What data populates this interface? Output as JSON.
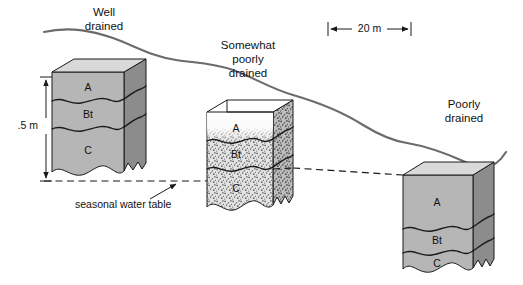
{
  "figure": {
    "background_color": "#ffffff",
    "width": 523,
    "height": 285
  },
  "colors": {
    "top_face": "#d9d9d9",
    "front_face": "#b6b6b6",
    "side_face": "#8c8c8c",
    "stipple_front": "#cfcfcf",
    "stipple_side": "#a8a8a8",
    "white_face": "#ffffff",
    "outline": "#1a1a1a",
    "surface_line": "#6b6b6b",
    "text": "#111111"
  },
  "scale_bar": {
    "label": "20 m",
    "x_start": 328,
    "x_end": 411,
    "y": 29
  },
  "depth_scale": {
    "label": ".5 m",
    "x": 38,
    "y_top": 77,
    "y_bottom": 183
  },
  "water_table": {
    "label": "seasonal water table",
    "y": 181,
    "x_start": 44,
    "x_end": 460,
    "leader_from_x": 152,
    "leader_from_y": 198,
    "leader_to_x": 175,
    "leader_to_y": 184
  },
  "drainage_labels": [
    {
      "id": "well-drained",
      "lines": [
        "Well",
        "drained"
      ],
      "x": 104,
      "y": 13,
      "class": "Well drained"
    },
    {
      "id": "somewhat-poorly-drained",
      "lines": [
        "Somewhat",
        "poorly",
        "drained"
      ],
      "x": 248,
      "y": 44,
      "class": "Somewhat poorly drained"
    },
    {
      "id": "poorly-drained",
      "lines": [
        "Poorly",
        "drained"
      ],
      "x": 464,
      "y": 103,
      "class": "Poorly drained"
    }
  ],
  "blocks": [
    {
      "id": "well-drained-block",
      "drainage_class": "Well drained",
      "position": "upslope",
      "texture": "solid",
      "left": 52,
      "right": 124,
      "top": 72,
      "bottom": 181,
      "depth_dx": 22,
      "depth_dy": -13,
      "horizons": [
        {
          "name": "A",
          "top": 72,
          "bottom": 100,
          "label_y": 88
        },
        {
          "name": "Bt",
          "top": 100,
          "bottom": 127,
          "label_y": 115
        },
        {
          "name": "C",
          "top": 127,
          "bottom": 181,
          "label_y": 152
        }
      ]
    },
    {
      "id": "somewhat-poorly-drained-block",
      "drainage_class": "Somewhat poorly drained",
      "position": "midslope",
      "texture": "mottled",
      "left": 207,
      "right": 273,
      "top": 112,
      "bottom": 213,
      "depth_dx": 20,
      "depth_dy": -12,
      "horizons": [
        {
          "name": "A",
          "top": 112,
          "bottom": 140,
          "label_y": 129
        },
        {
          "name": "Bt",
          "top": 140,
          "bottom": 168,
          "label_y": 155
        },
        {
          "name": "C",
          "top": 168,
          "bottom": 213,
          "label_y": 190
        }
      ]
    },
    {
      "id": "poorly-drained-block",
      "drainage_class": "Poorly drained",
      "position": "downslope",
      "texture": "solid",
      "left": 403,
      "right": 473,
      "top": 175,
      "bottom": 277,
      "depth_dx": 21,
      "depth_dy": -13,
      "horizons": [
        {
          "name": "A",
          "top": 175,
          "bottom": 228,
          "label_y": 203
        },
        {
          "name": "Bt",
          "top": 228,
          "bottom": 252,
          "label_y": 241
        },
        {
          "name": "C",
          "top": 252,
          "bottom": 277,
          "label_y": 265
        }
      ]
    }
  ],
  "land_surface": {
    "stroke": "#6b6b6b",
    "path": "M 44,32 C 70,27 92,31 112,38 C 134,46 152,56 175,60 C 196,64 212,63 232,70 C 252,77 268,88 292,95 C 316,102 340,110 362,124 C 380,135 392,140 406,142 C 424,145 444,152 462,160 C 478,167 492,172 505,151"
  }
}
